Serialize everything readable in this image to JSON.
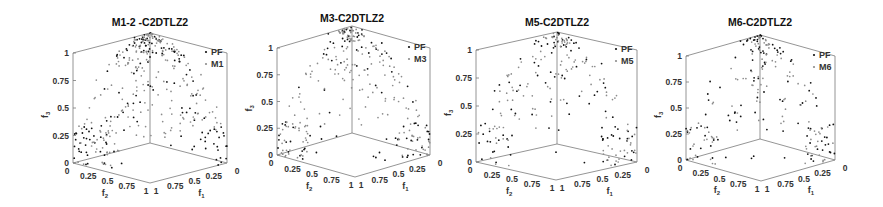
{
  "figure": {
    "background": "#ffffff",
    "axis_color": "#7a7a7a",
    "text_color": "#333333",
    "pf_color": "#111111",
    "method_color": "#8c8c8c"
  },
  "chart_data": [
    {
      "type": "scatter3d",
      "title": "M1-2 -C2DTLZ2",
      "xlabel": "f1",
      "ylabel": "f2",
      "zlabel": "f3",
      "x_ticks": [
        "0",
        "0.25",
        "0.5",
        "0.75",
        "1"
      ],
      "y_ticks": [
        "0",
        "0.25",
        "0.5",
        "0.75",
        "1"
      ],
      "z_ticks": [
        "0",
        "0.25",
        "0.5",
        "0.75",
        "1"
      ],
      "xlim": [
        0,
        1
      ],
      "ylim": [
        0,
        1
      ],
      "zlim": [
        0,
        1
      ],
      "legend": [
        "PF",
        "M1"
      ],
      "legend_position": "upper right",
      "grid": false,
      "geom": {
        "left": 73,
        "top": 53,
        "bottom": 163,
        "vx": 150,
        "vy": 183,
        "right": 227,
        "apex_y": 35
      },
      "series": [
        {
          "name": "PF",
          "seed": 11,
          "count": 150,
          "region": "full"
        },
        {
          "name": "M1",
          "seed": 17,
          "count": 230,
          "region": "sphere-upper"
        }
      ]
    },
    {
      "type": "scatter3d",
      "title": "M3-C2DTLZ2",
      "xlabel": "f1",
      "ylabel": "f2",
      "zlabel": "f3",
      "x_ticks": [
        "0",
        "0.25",
        "0.5",
        "0.75",
        "1"
      ],
      "y_ticks": [
        "0",
        "0.25",
        "0.5",
        "0.75",
        "1"
      ],
      "z_ticks": [
        "0",
        "0.25",
        "0.5",
        "0.75",
        "1"
      ],
      "xlim": [
        0,
        1
      ],
      "ylim": [
        0,
        1
      ],
      "zlim": [
        0,
        1
      ],
      "legend": [
        "PF",
        "M3"
      ],
      "legend_position": "upper right",
      "grid": false,
      "geom": {
        "left": 277,
        "top": 48,
        "bottom": 155,
        "vx": 352,
        "vy": 177,
        "right": 430,
        "apex_y": 28
      },
      "series": [
        {
          "name": "PF",
          "seed": 23,
          "count": 90,
          "region": "full"
        },
        {
          "name": "M3",
          "seed": 29,
          "count": 200,
          "region": "clusters"
        }
      ]
    },
    {
      "type": "scatter3d",
      "title": "M5-C2DTLZ2",
      "xlabel": "f1",
      "ylabel": "f2",
      "zlabel": "f3",
      "x_ticks": [
        "0",
        "0.25",
        "0.5",
        "0.75",
        "1"
      ],
      "y_ticks": [
        "0",
        "0.25",
        "0.5",
        "0.75",
        "1"
      ],
      "z_ticks": [
        "0",
        "0.25",
        "0.5",
        "0.75",
        "1"
      ],
      "xlim": [
        0,
        1
      ],
      "ylim": [
        0,
        1
      ],
      "zlim": [
        0,
        1
      ],
      "legend": [
        "PF",
        "M5"
      ],
      "legend_position": "upper right",
      "grid": false,
      "geom": {
        "left": 476,
        "top": 50,
        "bottom": 162,
        "vx": 557,
        "vy": 180,
        "right": 637,
        "apex_y": 33
      },
      "series": [
        {
          "name": "PF",
          "seed": 31,
          "count": 100,
          "region": "full"
        },
        {
          "name": "M5",
          "seed": 37,
          "count": 130,
          "region": "clusters"
        }
      ]
    },
    {
      "type": "scatter3d",
      "title": "M6-C2DTLZ2",
      "xlabel": "f1",
      "ylabel": "f2",
      "zlabel": "f3",
      "x_ticks": [
        "0",
        "0.25",
        "0.5",
        "0.75",
        "1"
      ],
      "y_ticks": [
        "0",
        "0.25",
        "0.5",
        "0.75",
        "1"
      ],
      "z_ticks": [
        "0",
        "0.25",
        "0.5",
        "0.75",
        "1"
      ],
      "xlim": [
        0,
        1
      ],
      "ylim": [
        0,
        1
      ],
      "zlim": [
        0,
        1
      ],
      "legend": [
        "PF",
        "M6"
      ],
      "legend_position": "upper right",
      "grid": false,
      "geom": {
        "left": 686,
        "top": 56,
        "bottom": 160,
        "vx": 760,
        "vy": 181,
        "right": 835,
        "apex_y": 37
      },
      "series": [
        {
          "name": "PF",
          "seed": 41,
          "count": 110,
          "region": "full"
        },
        {
          "name": "M6",
          "seed": 43,
          "count": 110,
          "region": "clusters"
        }
      ]
    }
  ]
}
